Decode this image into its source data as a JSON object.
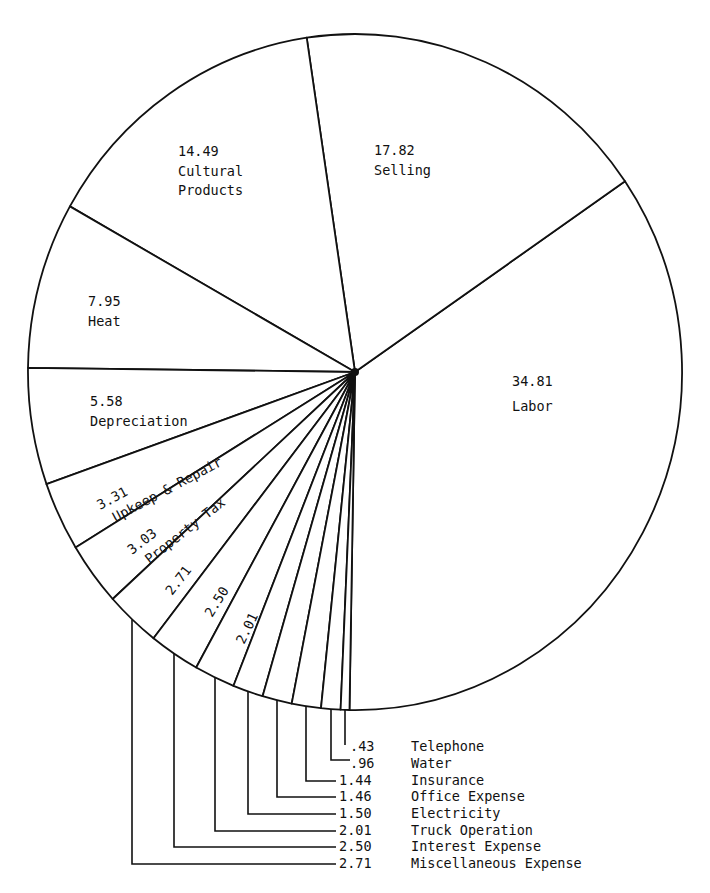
{
  "chart_data": {
    "type": "pie",
    "title": "",
    "unit": "percent",
    "slices": [
      {
        "label": "Labor",
        "value": 34.81
      },
      {
        "label": "Selling",
        "value": 17.82
      },
      {
        "label": "Cultural Products",
        "value": 14.49
      },
      {
        "label": "Heat",
        "value": 7.95
      },
      {
        "label": "Depreciation",
        "value": 5.58
      },
      {
        "label": "Upkeep & Repair",
        "value": 3.31
      },
      {
        "label": "Property Tax",
        "value": 3.03
      },
      {
        "label": "Miscellaneous Expense",
        "value": 2.71
      },
      {
        "label": "Interest Expense",
        "value": 2.5
      },
      {
        "label": "Truck Operation",
        "value": 2.01
      },
      {
        "label": "Electricity",
        "value": 1.5
      },
      {
        "label": "Office Expense",
        "value": 1.46
      },
      {
        "label": "Insurance",
        "value": 1.44
      },
      {
        "label": "Water",
        "value": 0.96
      },
      {
        "label": "Telephone",
        "value": 0.43
      }
    ],
    "inside_labels": [
      {
        "value": "34.81",
        "name": "Labor"
      },
      {
        "value": "17.82",
        "name": "Selling"
      },
      {
        "value": "14.49",
        "name": "Cultural",
        "name2": "Products"
      },
      {
        "value": "7.95",
        "name": "Heat"
      },
      {
        "value": "5.58",
        "name": "Depreciation"
      },
      {
        "value": "3.31",
        "name": "Upkeep & Repair"
      },
      {
        "value": "3.03",
        "name": "Property Tax"
      },
      {
        "value": "2.71"
      },
      {
        "value": "2.50"
      },
      {
        "value": "2.01"
      }
    ],
    "callout_legend": [
      {
        "value": ".43",
        "label": "Telephone"
      },
      {
        "value": ".96",
        "label": "Water"
      },
      {
        "value": "1.44",
        "label": "Insurance"
      },
      {
        "value": "1.46",
        "label": "Office Expense"
      },
      {
        "value": "1.50",
        "label": "Electricity"
      },
      {
        "value": "2.01",
        "label": "Truck Operation"
      },
      {
        "value": "2.50",
        "label": "Interest Expense"
      },
      {
        "value": "2.71",
        "label": "Miscellaneous Expense"
      }
    ],
    "colors": {
      "stroke": "#111111",
      "fill": "#ffffff"
    }
  }
}
